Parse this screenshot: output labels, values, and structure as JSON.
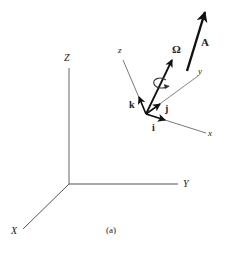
{
  "figure": {
    "caption": "(a)",
    "fixed_frame": {
      "axis_labels": {
        "X": "X",
        "Y": "Y",
        "Z": "Z"
      }
    },
    "moving_frame": {
      "axis_labels": {
        "x": "x",
        "y": "y",
        "z": "z"
      },
      "unit_vectors": {
        "i": "i",
        "j": "j",
        "k": "k"
      }
    },
    "vectors": {
      "angular_velocity": "Ω",
      "A": "A"
    },
    "colors": {
      "thin_axis": "#555555",
      "vector": "#111111",
      "background": "#ffffff"
    }
  }
}
